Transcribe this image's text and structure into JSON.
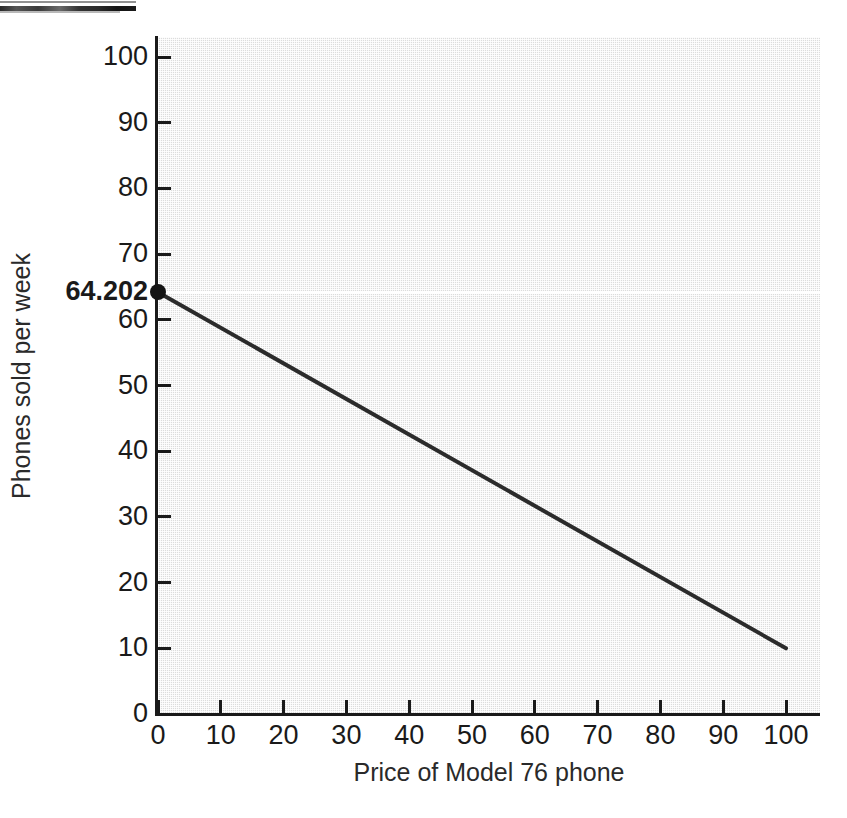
{
  "artifact": {
    "name": "clipped-scan-text-fragment",
    "legible": false
  },
  "chart_data": {
    "type": "line",
    "title": "",
    "xlabel": "Price of Model 76 phone",
    "ylabel": "Phones sold per week",
    "xlim": [
      0,
      105
    ],
    "ylim": [
      0,
      103
    ],
    "xticks": [
      0,
      10,
      20,
      30,
      40,
      50,
      60,
      70,
      80,
      90,
      100
    ],
    "xtick_labels": [
      "0",
      "10",
      "20",
      "30",
      "40",
      "50",
      "60",
      "70",
      "80",
      "90",
      "100"
    ],
    "yticks": [
      0,
      10,
      20,
      30,
      40,
      50,
      60,
      70,
      80,
      90,
      100
    ],
    "ytick_labels": [
      "0",
      "10",
      "20",
      "30",
      "40",
      "50",
      "60",
      "70",
      "80",
      "90",
      "100"
    ],
    "grid": false,
    "legend": null,
    "plot_background": "#dcdcdc",
    "line_color": "#2b2b2b",
    "series": [
      {
        "name": "Demand for Model 76 phone",
        "x": [
          0,
          100
        ],
        "values": [
          64.202,
          10
        ]
      }
    ],
    "annotations": [
      {
        "name": "y-intercept",
        "label": "64.202",
        "x": 0,
        "y": 64.202,
        "marker": "filled-circle",
        "gridline": true,
        "gridline_color": "#ffffff"
      }
    ]
  }
}
